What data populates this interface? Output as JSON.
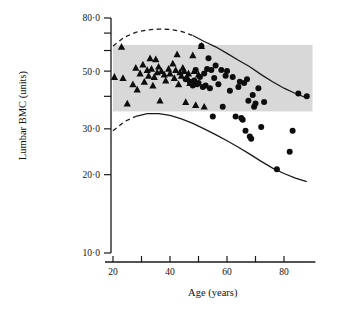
{
  "figure": {
    "background": "#ffffff",
    "band_color": "#d8d8d8",
    "marker_color": "#0d0d0d"
  },
  "chart_data": {
    "type": "scatter",
    "title": "",
    "xlabel": "Age (years)",
    "ylabel": "Lumbar BMC (units)",
    "xlim": [
      15,
      92
    ],
    "ylim": [
      10.0,
      85.0
    ],
    "yscale": "log",
    "grid": false,
    "legend_position": "none",
    "xticks": [
      20,
      30,
      40,
      50,
      60,
      70,
      80
    ],
    "xtick_labels": [
      "20",
      "",
      "40",
      "",
      "60",
      "",
      "80"
    ],
    "yticks": [
      10.0,
      20.0,
      30.0,
      40.0,
      50.0,
      60.0,
      70.0,
      80.0
    ],
    "ytick_labels": [
      "10·0",
      "20·0",
      "30·0",
      "",
      "50·0",
      "",
      "",
      "80·0"
    ],
    "normal_range_band": {
      "x_start": 20,
      "x_end": 90,
      "y_low": 35.0,
      "y_high": 63.0
    },
    "series": [
      {
        "name": "premenopausal",
        "marker": "triangle",
        "points": [
          [
            20.5,
            47.5
          ],
          [
            23.0,
            62.0
          ],
          [
            23.5,
            47.0
          ],
          [
            25.0,
            37.5
          ],
          [
            27.0,
            44.5
          ],
          [
            28.0,
            51.5
          ],
          [
            28.5,
            42.5
          ],
          [
            29.5,
            49.0
          ],
          [
            30.5,
            53.0
          ],
          [
            31.0,
            45.5
          ],
          [
            32.0,
            50.5
          ],
          [
            32.5,
            48.0
          ],
          [
            33.0,
            56.0
          ],
          [
            33.5,
            51.0
          ],
          [
            34.0,
            44.0
          ],
          [
            34.5,
            47.5
          ],
          [
            35.0,
            55.5
          ],
          [
            35.5,
            49.5
          ],
          [
            36.0,
            52.0
          ],
          [
            36.5,
            38.5
          ],
          [
            37.0,
            50.0
          ],
          [
            38.0,
            48.5
          ],
          [
            38.5,
            46.0
          ],
          [
            39.5,
            51.0
          ],
          [
            40.0,
            49.0
          ],
          [
            41.0,
            53.5
          ],
          [
            41.5,
            47.0
          ],
          [
            42.0,
            50.5
          ],
          [
            42.5,
            58.0
          ],
          [
            43.0,
            44.5
          ],
          [
            43.5,
            49.5
          ],
          [
            44.0,
            48.0
          ],
          [
            44.5,
            51.5
          ],
          [
            45.0,
            50.0
          ],
          [
            45.5,
            38.0
          ],
          [
            46.0,
            47.5
          ],
          [
            46.5,
            49.0
          ],
          [
            47.0,
            45.0
          ],
          [
            48.0,
            57.5
          ],
          [
            48.5,
            50.0
          ],
          [
            49.0,
            37.0
          ],
          [
            50.0,
            48.5
          ],
          [
            51.0,
            62.5
          ],
          [
            52.0,
            36.5
          ]
        ]
      },
      {
        "name": "postmenopausal",
        "marker": "circle",
        "points": [
          [
            45.5,
            46.5
          ],
          [
            47.0,
            45.5
          ],
          [
            48.0,
            44.0
          ],
          [
            48.5,
            46.0
          ],
          [
            49.0,
            50.5
          ],
          [
            49.5,
            44.5
          ],
          [
            50.0,
            45.0
          ],
          [
            50.5,
            47.5
          ],
          [
            51.0,
            62.5
          ],
          [
            51.5,
            43.5
          ],
          [
            52.0,
            49.0
          ],
          [
            52.5,
            44.0
          ],
          [
            53.0,
            51.0
          ],
          [
            53.5,
            56.0
          ],
          [
            54.0,
            43.0
          ],
          [
            54.5,
            50.5
          ],
          [
            55.0,
            33.5
          ],
          [
            55.5,
            47.0
          ],
          [
            56.0,
            52.5
          ],
          [
            57.0,
            44.5
          ],
          [
            58.0,
            50.5
          ],
          [
            58.5,
            36.5
          ],
          [
            59.5,
            48.0
          ],
          [
            60.0,
            50.0
          ],
          [
            61.0,
            42.0
          ],
          [
            62.0,
            47.5
          ],
          [
            63.0,
            33.5
          ],
          [
            64.0,
            43.5
          ],
          [
            64.5,
            45.5
          ],
          [
            65.0,
            33.0
          ],
          [
            65.5,
            32.5
          ],
          [
            66.0,
            45.0
          ],
          [
            66.5,
            29.5
          ],
          [
            67.0,
            46.5
          ],
          [
            67.5,
            38.5
          ],
          [
            68.0,
            28.0
          ],
          [
            68.5,
            27.5
          ],
          [
            69.0,
            40.5
          ],
          [
            69.5,
            36.5
          ],
          [
            70.0,
            37.5
          ],
          [
            71.0,
            43.0
          ],
          [
            72.0,
            30.5
          ],
          [
            73.0,
            38.0
          ],
          [
            77.5,
            21.0
          ],
          [
            82.0,
            24.5
          ],
          [
            83.0,
            29.5
          ],
          [
            85.0,
            41.0
          ],
          [
            88.0,
            40.0
          ]
        ]
      }
    ],
    "reference_curves": [
      {
        "name": "upper-limit",
        "style": "dashed-then-solid",
        "dash_until_x": 50,
        "points": [
          [
            20.0,
            62.5
          ],
          [
            24.0,
            67.5
          ],
          [
            28.0,
            70.5
          ],
          [
            32.0,
            72.0
          ],
          [
            36.0,
            72.5
          ],
          [
            40.0,
            72.3
          ],
          [
            44.0,
            71.0
          ],
          [
            48.0,
            68.5
          ],
          [
            52.0,
            65.0
          ],
          [
            56.0,
            62.0
          ],
          [
            60.0,
            58.5
          ],
          [
            64.0,
            55.0
          ],
          [
            68.0,
            52.0
          ],
          [
            72.0,
            48.5
          ],
          [
            76.0,
            45.5
          ],
          [
            80.0,
            43.0
          ],
          [
            84.0,
            41.0
          ],
          [
            88.0,
            39.5
          ]
        ]
      },
      {
        "name": "lower-limit",
        "style": "dashed-then-solid",
        "dash_until_x": 31,
        "points": [
          [
            20.0,
            29.5
          ],
          [
            24.0,
            32.0
          ],
          [
            28.0,
            33.5
          ],
          [
            32.0,
            34.3
          ],
          [
            36.0,
            34.3
          ],
          [
            40.0,
            33.8
          ],
          [
            44.0,
            32.8
          ],
          [
            48.0,
            31.5
          ],
          [
            52.0,
            30.0
          ],
          [
            56.0,
            28.5
          ],
          [
            60.0,
            27.0
          ],
          [
            64.0,
            25.5
          ],
          [
            68.0,
            24.0
          ],
          [
            72.0,
            22.5
          ],
          [
            76.0,
            21.2
          ],
          [
            80.0,
            20.2
          ],
          [
            84.0,
            19.4
          ],
          [
            88.0,
            18.8
          ]
        ]
      }
    ]
  }
}
